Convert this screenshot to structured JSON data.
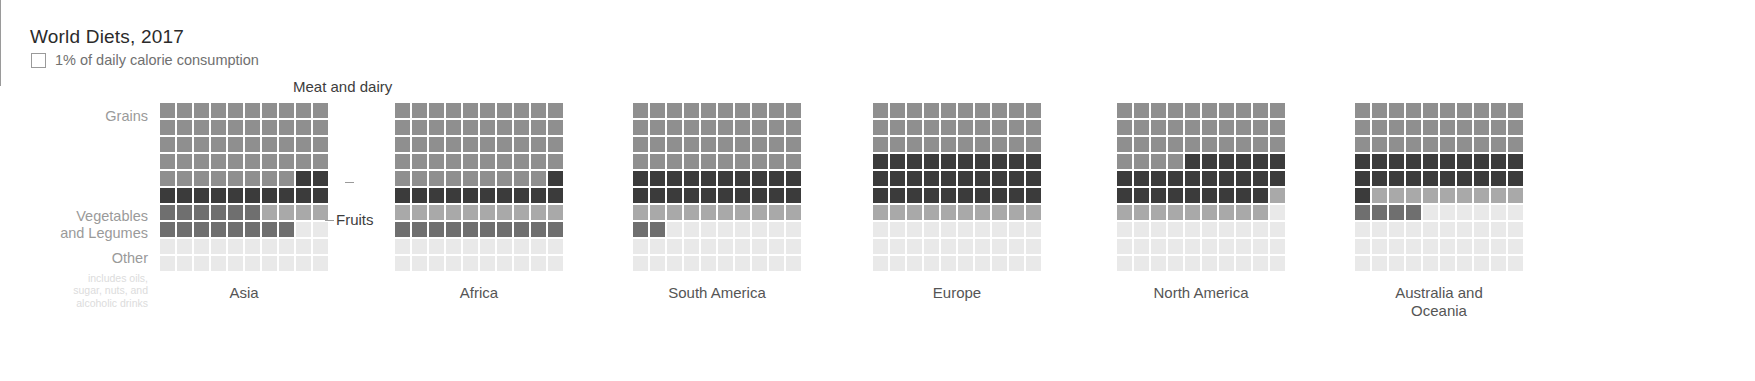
{
  "header": {
    "title": "World Diets, 2017",
    "legend_label": "1% of daily calorie consumption",
    "legend_swatch_icon": "empty-square-icon"
  },
  "row_labels": {
    "grains": "Grains",
    "vegetables": "Vegetables\nand Legumes",
    "other": "Other",
    "other_note": "includes oils,\nsugar, nuts, and\nalcoholic drinks"
  },
  "annotations": {
    "meat_and_dairy": "Meat and dairy",
    "fruits": "Fruits"
  },
  "colors": {
    "grains": "#8f8f8f",
    "meat_and_dairy": "#3b3b3b",
    "fruits": "#a9a9a9",
    "vegetables_and_legumes": "#6f6f6f",
    "other": "#e9e9e9",
    "text_dark": "#2b2b2b",
    "text_muted": "#707070",
    "label_gray": "#9a9a9a"
  },
  "chart_data": {
    "type": "waffle",
    "title": "World Diets, 2017",
    "unit": "1% of daily calorie consumption",
    "grid": {
      "rows": 10,
      "cols": 10,
      "cell_value": 1
    },
    "categories": [
      {
        "key": "grains",
        "label": "Grains",
        "color": "#8f8f8f"
      },
      {
        "key": "meat_and_dairy",
        "label": "Meat and dairy",
        "color": "#3b3b3b"
      },
      {
        "key": "fruits",
        "label": "Fruits",
        "color": "#a9a9a9"
      },
      {
        "key": "vegetables_and_legumes",
        "label": "Vegetables and Legumes",
        "color": "#6f6f6f"
      },
      {
        "key": "other",
        "label": "Other",
        "color": "#e9e9e9"
      }
    ],
    "regions": [
      {
        "name": "Asia",
        "values": {
          "grains": 48,
          "meat_and_dairy": 12,
          "fruits": 4,
          "vegetables_and_legumes": 16,
          "other": 20
        },
        "cells": [
          [
            "grains",
            "grains",
            "grains",
            "grains",
            "grains",
            "grains",
            "grains",
            "grains",
            "grains",
            "grains"
          ],
          [
            "grains",
            "grains",
            "grains",
            "grains",
            "grains",
            "grains",
            "grains",
            "grains",
            "grains",
            "grains"
          ],
          [
            "grains",
            "grains",
            "grains",
            "grains",
            "grains",
            "grains",
            "grains",
            "grains",
            "grains",
            "grains"
          ],
          [
            "grains",
            "grains",
            "grains",
            "grains",
            "grains",
            "grains",
            "grains",
            "grains",
            "grains",
            "grains"
          ],
          [
            "grains",
            "grains",
            "grains",
            "grains",
            "grains",
            "grains",
            "grains",
            "grains",
            "meat_and_dairy",
            "meat_and_dairy"
          ],
          [
            "meat_and_dairy",
            "meat_and_dairy",
            "meat_and_dairy",
            "meat_and_dairy",
            "meat_and_dairy",
            "meat_and_dairy",
            "meat_and_dairy",
            "meat_and_dairy",
            "meat_and_dairy",
            "meat_and_dairy"
          ],
          [
            "vegetables_and_legumes",
            "vegetables_and_legumes",
            "vegetables_and_legumes",
            "vegetables_and_legumes",
            "vegetables_and_legumes",
            "vegetables_and_legumes",
            "fruits",
            "fruits",
            "fruits",
            "fruits"
          ],
          [
            "vegetables_and_legumes",
            "vegetables_and_legumes",
            "vegetables_and_legumes",
            "vegetables_and_legumes",
            "vegetables_and_legumes",
            "vegetables_and_legumes",
            "vegetables_and_legumes",
            "vegetables_and_legumes",
            "other",
            "other"
          ],
          [
            "other",
            "other",
            "other",
            "other",
            "other",
            "other",
            "other",
            "other",
            "other",
            "other"
          ],
          [
            "other",
            "other",
            "other",
            "other",
            "other",
            "other",
            "other",
            "other",
            "other",
            "other"
          ]
        ]
      },
      {
        "name": "Africa",
        "values": {
          "grains": 49,
          "meat_and_dairy": 11,
          "fruits": 10,
          "vegetables_and_legumes": 10,
          "other": 20
        },
        "cells": [
          [
            "grains",
            "grains",
            "grains",
            "grains",
            "grains",
            "grains",
            "grains",
            "grains",
            "grains",
            "grains"
          ],
          [
            "grains",
            "grains",
            "grains",
            "grains",
            "grains",
            "grains",
            "grains",
            "grains",
            "grains",
            "grains"
          ],
          [
            "grains",
            "grains",
            "grains",
            "grains",
            "grains",
            "grains",
            "grains",
            "grains",
            "grains",
            "grains"
          ],
          [
            "grains",
            "grains",
            "grains",
            "grains",
            "grains",
            "grains",
            "grains",
            "grains",
            "grains",
            "grains"
          ],
          [
            "grains",
            "grains",
            "grains",
            "grains",
            "grains",
            "grains",
            "grains",
            "grains",
            "grains",
            "meat_and_dairy"
          ],
          [
            "meat_and_dairy",
            "meat_and_dairy",
            "meat_and_dairy",
            "meat_and_dairy",
            "meat_and_dairy",
            "meat_and_dairy",
            "meat_and_dairy",
            "meat_and_dairy",
            "meat_and_dairy",
            "meat_and_dairy"
          ],
          [
            "fruits",
            "fruits",
            "fruits",
            "fruits",
            "fruits",
            "fruits",
            "fruits",
            "fruits",
            "fruits",
            "fruits"
          ],
          [
            "vegetables_and_legumes",
            "vegetables_and_legumes",
            "vegetables_and_legumes",
            "vegetables_and_legumes",
            "vegetables_and_legumes",
            "vegetables_and_legumes",
            "vegetables_and_legumes",
            "vegetables_and_legumes",
            "vegetables_and_legumes",
            "vegetables_and_legumes"
          ],
          [
            "other",
            "other",
            "other",
            "other",
            "other",
            "other",
            "other",
            "other",
            "other",
            "other"
          ],
          [
            "other",
            "other",
            "other",
            "other",
            "other",
            "other",
            "other",
            "other",
            "other",
            "other"
          ]
        ]
      },
      {
        "name": "South America",
        "values": {
          "grains": 38,
          "meat_and_dairy": 20,
          "fruits": 10,
          "vegetables_and_legumes": 2,
          "other": 30
        },
        "cells": [
          [
            "grains",
            "grains",
            "grains",
            "grains",
            "grains",
            "grains",
            "grains",
            "grains",
            "grains",
            "grains"
          ],
          [
            "grains",
            "grains",
            "grains",
            "grains",
            "grains",
            "grains",
            "grains",
            "grains",
            "grains",
            "grains"
          ],
          [
            "grains",
            "grains",
            "grains",
            "grains",
            "grains",
            "grains",
            "grains",
            "grains",
            "grains",
            "grains"
          ],
          [
            "grains",
            "grains",
            "grains",
            "grains",
            "grains",
            "grains",
            "grains",
            "grains",
            "grains",
            "grains"
          ],
          [
            "meat_and_dairy",
            "meat_and_dairy",
            "meat_and_dairy",
            "meat_and_dairy",
            "meat_and_dairy",
            "meat_and_dairy",
            "meat_and_dairy",
            "meat_and_dairy",
            "meat_and_dairy",
            "meat_and_dairy"
          ],
          [
            "meat_and_dairy",
            "meat_and_dairy",
            "meat_and_dairy",
            "meat_and_dairy",
            "meat_and_dairy",
            "meat_and_dairy",
            "meat_and_dairy",
            "meat_and_dairy",
            "meat_and_dairy",
            "meat_and_dairy"
          ],
          [
            "fruits",
            "fruits",
            "fruits",
            "fruits",
            "fruits",
            "fruits",
            "fruits",
            "fruits",
            "fruits",
            "fruits"
          ],
          [
            "vegetables_and_legumes",
            "vegetables_and_legumes",
            "other",
            "other",
            "other",
            "other",
            "other",
            "other",
            "other",
            "other"
          ],
          [
            "other",
            "other",
            "other",
            "other",
            "other",
            "other",
            "other",
            "other",
            "other",
            "other"
          ],
          [
            "other",
            "other",
            "other",
            "other",
            "other",
            "other",
            "other",
            "other",
            "other",
            "other"
          ]
        ]
      },
      {
        "name": "Europe",
        "values": {
          "grains": 30,
          "meat_and_dairy": 30,
          "fruits": 10,
          "vegetables_and_legumes": 0,
          "other": 30
        },
        "cells": [
          [
            "grains",
            "grains",
            "grains",
            "grains",
            "grains",
            "grains",
            "grains",
            "grains",
            "grains",
            "grains"
          ],
          [
            "grains",
            "grains",
            "grains",
            "grains",
            "grains",
            "grains",
            "grains",
            "grains",
            "grains",
            "grains"
          ],
          [
            "grains",
            "grains",
            "grains",
            "grains",
            "grains",
            "grains",
            "grains",
            "grains",
            "grains",
            "grains"
          ],
          [
            "meat_and_dairy",
            "meat_and_dairy",
            "meat_and_dairy",
            "meat_and_dairy",
            "meat_and_dairy",
            "meat_and_dairy",
            "meat_and_dairy",
            "meat_and_dairy",
            "meat_and_dairy",
            "meat_and_dairy"
          ],
          [
            "meat_and_dairy",
            "meat_and_dairy",
            "meat_and_dairy",
            "meat_and_dairy",
            "meat_and_dairy",
            "meat_and_dairy",
            "meat_and_dairy",
            "meat_and_dairy",
            "meat_and_dairy",
            "meat_and_dairy"
          ],
          [
            "meat_and_dairy",
            "meat_and_dairy",
            "meat_and_dairy",
            "meat_and_dairy",
            "meat_and_dairy",
            "meat_and_dairy",
            "meat_and_dairy",
            "meat_and_dairy",
            "meat_and_dairy",
            "meat_and_dairy"
          ],
          [
            "fruits",
            "fruits",
            "fruits",
            "fruits",
            "fruits",
            "fruits",
            "fruits",
            "fruits",
            "fruits",
            "fruits"
          ],
          [
            "other",
            "other",
            "other",
            "other",
            "other",
            "other",
            "other",
            "other",
            "other",
            "other"
          ],
          [
            "other",
            "other",
            "other",
            "other",
            "other",
            "other",
            "other",
            "other",
            "other",
            "other"
          ],
          [
            "other",
            "other",
            "other",
            "other",
            "other",
            "other",
            "other",
            "other",
            "other",
            "other"
          ]
        ]
      },
      {
        "name": "North America",
        "values": {
          "grains": 34,
          "meat_and_dairy": 26,
          "fruits": 10,
          "vegetables_and_legumes": 0,
          "other": 30
        },
        "cells": [
          [
            "grains",
            "grains",
            "grains",
            "grains",
            "grains",
            "grains",
            "grains",
            "grains",
            "grains",
            "grains"
          ],
          [
            "grains",
            "grains",
            "grains",
            "grains",
            "grains",
            "grains",
            "grains",
            "grains",
            "grains",
            "grains"
          ],
          [
            "grains",
            "grains",
            "grains",
            "grains",
            "grains",
            "grains",
            "grains",
            "grains",
            "grains",
            "grains"
          ],
          [
            "grains",
            "grains",
            "grains",
            "grains",
            "meat_and_dairy",
            "meat_and_dairy",
            "meat_and_dairy",
            "meat_and_dairy",
            "meat_and_dairy",
            "meat_and_dairy"
          ],
          [
            "meat_and_dairy",
            "meat_and_dairy",
            "meat_and_dairy",
            "meat_and_dairy",
            "meat_and_dairy",
            "meat_and_dairy",
            "meat_and_dairy",
            "meat_and_dairy",
            "meat_and_dairy",
            "meat_and_dairy"
          ],
          [
            "meat_and_dairy",
            "meat_and_dairy",
            "meat_and_dairy",
            "meat_and_dairy",
            "meat_and_dairy",
            "meat_and_dairy",
            "meat_and_dairy",
            "meat_and_dairy",
            "meat_and_dairy",
            "fruits"
          ],
          [
            "fruits",
            "fruits",
            "fruits",
            "fruits",
            "fruits",
            "fruits",
            "fruits",
            "fruits",
            "fruits",
            "other"
          ],
          [
            "other",
            "other",
            "other",
            "other",
            "other",
            "other",
            "other",
            "other",
            "other",
            "other"
          ],
          [
            "other",
            "other",
            "other",
            "other",
            "other",
            "other",
            "other",
            "other",
            "other",
            "other"
          ],
          [
            "other",
            "other",
            "other",
            "other",
            "other",
            "other",
            "other",
            "other",
            "other",
            "other"
          ]
        ]
      },
      {
        "name": "Australia and\nOceania",
        "values": {
          "grains": 30,
          "meat_and_dairy": 20,
          "fruits": 10,
          "vegetables_and_legumes": 4,
          "other": 36
        },
        "cells": [
          [
            "grains",
            "grains",
            "grains",
            "grains",
            "grains",
            "grains",
            "grains",
            "grains",
            "grains",
            "grains"
          ],
          [
            "grains",
            "grains",
            "grains",
            "grains",
            "grains",
            "grains",
            "grains",
            "grains",
            "grains",
            "grains"
          ],
          [
            "grains",
            "grains",
            "grains",
            "grains",
            "grains",
            "grains",
            "grains",
            "grains",
            "grains",
            "grains"
          ],
          [
            "meat_and_dairy",
            "meat_and_dairy",
            "meat_and_dairy",
            "meat_and_dairy",
            "meat_and_dairy",
            "meat_and_dairy",
            "meat_and_dairy",
            "meat_and_dairy",
            "meat_and_dairy",
            "meat_and_dairy"
          ],
          [
            "meat_and_dairy",
            "meat_and_dairy",
            "meat_and_dairy",
            "meat_and_dairy",
            "meat_and_dairy",
            "meat_and_dairy",
            "meat_and_dairy",
            "meat_and_dairy",
            "meat_and_dairy",
            "meat_and_dairy"
          ],
          [
            "meat_and_dairy",
            "fruits",
            "fruits",
            "fruits",
            "fruits",
            "fruits",
            "fruits",
            "fruits",
            "fruits",
            "fruits"
          ],
          [
            "vegetables_and_legumes",
            "vegetables_and_legumes",
            "vegetables_and_legumes",
            "vegetables_and_legumes",
            "other",
            "other",
            "other",
            "other",
            "other",
            "other"
          ],
          [
            "other",
            "other",
            "other",
            "other",
            "other",
            "other",
            "other",
            "other",
            "other",
            "other"
          ],
          [
            "other",
            "other",
            "other",
            "other",
            "other",
            "other",
            "other",
            "other",
            "other",
            "other"
          ],
          [
            "other",
            "other",
            "other",
            "other",
            "other",
            "other",
            "other",
            "other",
            "other",
            "other"
          ]
        ]
      }
    ]
  },
  "layout": {
    "chart_left_offsets": [
      5,
      240,
      478,
      718,
      962,
      1200
    ]
  }
}
